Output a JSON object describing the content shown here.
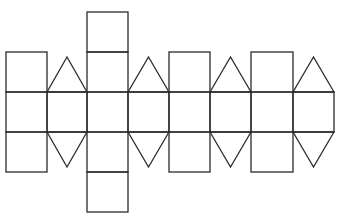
{
  "diagram": {
    "title": "",
    "stroke_color": "#2a2a2a",
    "background_color": "#ffffff",
    "columns_x": [
      6,
      47,
      87,
      128,
      169,
      210,
      251,
      293,
      334
    ],
    "rows_y": [
      12,
      52,
      92,
      132,
      172,
      211
    ],
    "band": {
      "top": 92,
      "bottom": 132,
      "cells": 8
    },
    "top_attachments": [
      {
        "type": "square",
        "col": 0
      },
      {
        "type": "triangle",
        "col": 1,
        "apex_y": 57
      },
      {
        "type": "square",
        "col": 2,
        "stacked": 2
      },
      {
        "type": "triangle",
        "col": 3,
        "apex_y": 57
      },
      {
        "type": "square",
        "col": 4
      },
      {
        "type": "triangle",
        "col": 5,
        "apex_y": 57
      },
      {
        "type": "square",
        "col": 6
      },
      {
        "type": "triangle",
        "col": 7,
        "apex_y": 57
      }
    ],
    "bottom_attachments": [
      {
        "type": "square",
        "col": 0
      },
      {
        "type": "triangle",
        "col": 1,
        "apex_y": 167
      },
      {
        "type": "square",
        "col": 2,
        "stacked": 2
      },
      {
        "type": "triangle",
        "col": 3,
        "apex_y": 167
      },
      {
        "type": "square",
        "col": 4
      },
      {
        "type": "triangle",
        "col": 5,
        "apex_y": 167
      },
      {
        "type": "square",
        "col": 6
      },
      {
        "type": "triangle",
        "col": 7,
        "apex_y": 167
      }
    ]
  }
}
